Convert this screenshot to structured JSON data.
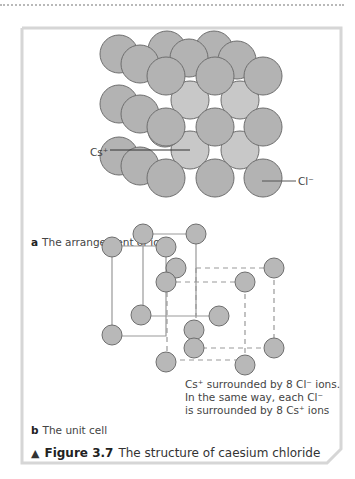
{
  "figure": {
    "part_a": {
      "letter": "a",
      "caption": "The arrangement of ions"
    },
    "part_b": {
      "letter": "b",
      "caption": "The unit cell"
    },
    "labels": {
      "cation": "Cs⁺",
      "anion": "Cl⁻"
    },
    "note_lines": [
      "Cs⁺ surrounded by 8 Cl⁻ ions.",
      "In the same way, each Cl⁻",
      "is surrounded by 8 Cs⁺ ions"
    ],
    "figure_marker": "▲",
    "figure_number": "Figure 3.7",
    "figure_title": "The structure of caesium chloride",
    "colors": {
      "ion_fill": "#b3b3b3",
      "ion_fill_light": "#c8c8c8",
      "ion_stroke": "#6e6e6e",
      "frame": "#d6d6d6"
    }
  }
}
